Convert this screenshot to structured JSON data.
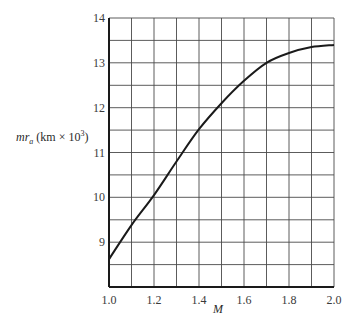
{
  "chart_data": {
    "type": "line",
    "title": "",
    "xlabel": "M",
    "ylabel": "mr_a (km × 10³)",
    "ylabel_parts": {
      "main": "mr",
      "sub": "a",
      "units": "(km × 10",
      "exp": "3",
      "close": ")"
    },
    "xlim": [
      1.0,
      2.0
    ],
    "ylim": [
      8.0,
      14.0
    ],
    "grid": true,
    "x_grid_step": 0.1,
    "y_grid_step": 0.5,
    "x_ticks": [
      1.0,
      1.2,
      1.4,
      1.6,
      1.8,
      2.0
    ],
    "x_tick_labels": [
      "1.0",
      "1.2",
      "1.4",
      "1.6",
      "1.8",
      "2.0"
    ],
    "y_ticks": [
      9,
      10,
      11,
      12,
      13,
      14
    ],
    "y_tick_labels": [
      "9",
      "10",
      "11",
      "12",
      "13",
      "14"
    ],
    "legend": null,
    "series": [
      {
        "name": "mr_a",
        "x": [
          1.0,
          1.1,
          1.2,
          1.3,
          1.4,
          1.5,
          1.6,
          1.7,
          1.8,
          1.9,
          2.0
        ],
        "values": [
          8.62,
          9.38,
          10.05,
          10.8,
          11.52,
          12.1,
          12.6,
          13.0,
          13.22,
          13.35,
          13.4
        ]
      }
    ]
  },
  "colors": {
    "axis": "#1a1a1a",
    "grid": "#4a4a4a",
    "line": "#1a1a1a",
    "background": "#ffffff"
  }
}
